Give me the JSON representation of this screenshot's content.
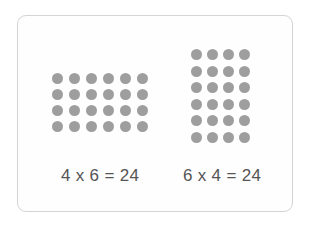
{
  "diagram": {
    "left_array": {
      "rows": 4,
      "cols": 6,
      "equation": "4 x 6 = 24"
    },
    "right_array": {
      "rows": 6,
      "cols": 4,
      "equation": "6 x 4 = 24"
    },
    "dot_color": "#9e9e9e",
    "text_color": "#555555"
  }
}
